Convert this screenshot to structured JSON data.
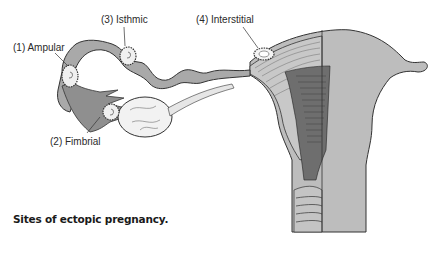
{
  "figure": {
    "caption": "Sites of ectopic pregnancy.",
    "labels": [
      {
        "id": "ampular",
        "text": "(1) Ampular"
      },
      {
        "id": "fimbrial",
        "text": "(2) Fimbrial"
      },
      {
        "id": "isthmic",
        "text": "(3) Isthmic"
      },
      {
        "id": "interstitial",
        "text": "(4) Interstitial"
      }
    ],
    "colors": {
      "tissue": "#b8b8b8",
      "tissue_dark": "#8a8a8a",
      "outline": "#333333",
      "light": "#e8e8e8",
      "background": "#ffffff"
    }
  }
}
